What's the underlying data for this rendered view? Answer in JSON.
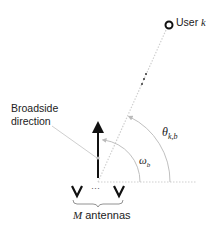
{
  "diagram": {
    "user_label": "User",
    "user_symbol": "k",
    "broadside_label_line1": "Broadside",
    "broadside_label_line2": "direction",
    "theta_label": "θ",
    "theta_sub": "k,b",
    "omega_label": "ω",
    "omega_sub": "b",
    "array_dots": "···",
    "antennas_symbol": "M",
    "antennas_label": "antennas",
    "colors": {
      "line_gray": "#c8c8c8",
      "arc_gray": "#bdbdbd",
      "arrow_black": "#111111",
      "text": "#222222"
    }
  }
}
